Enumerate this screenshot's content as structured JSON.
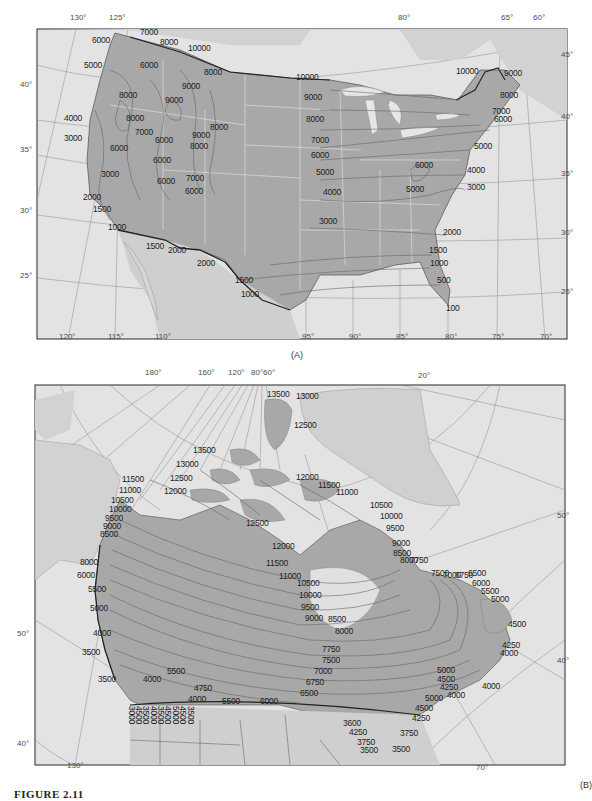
{
  "figure": {
    "caption": "FIGURE 2.11",
    "colors": {
      "land_highlight": "#a9a9a9",
      "land_other": "#d4d4d4",
      "ocean": "#e6e6e6",
      "contour": "#6b6b6b",
      "border": "#2b2b2b",
      "state_lines": "#f2f2f2",
      "text": "#1e1e1e"
    }
  },
  "panel_a": {
    "label": "(A)",
    "top_longitude_ticks": [
      {
        "text": "130°",
        "x": 70,
        "y": 20
      },
      {
        "text": "125°",
        "x": 109,
        "y": 20
      },
      {
        "text": "80°",
        "x": 398,
        "y": 20
      },
      {
        "text": "65°",
        "x": 501,
        "y": 20
      },
      {
        "text": "60°",
        "x": 533,
        "y": 20
      }
    ],
    "bottom_longitude_ticks": [
      {
        "text": "120°",
        "x": 59,
        "y": 339
      },
      {
        "text": "115°",
        "x": 108,
        "y": 339
      },
      {
        "text": "110°",
        "x": 155,
        "y": 339
      },
      {
        "text": "95°",
        "x": 302,
        "y": 339
      },
      {
        "text": "90°",
        "x": 349,
        "y": 339
      },
      {
        "text": "85°",
        "x": 396,
        "y": 339
      },
      {
        "text": "80°",
        "x": 445,
        "y": 339
      },
      {
        "text": "75°",
        "x": 492,
        "y": 339
      },
      {
        "text": "70°",
        "x": 540,
        "y": 339
      }
    ],
    "left_latitude_ticks": [
      {
        "text": "40°",
        "x": 20,
        "y": 87
      },
      {
        "text": "35°",
        "x": 20,
        "y": 152
      },
      {
        "text": "30°",
        "x": 20,
        "y": 213
      },
      {
        "text": "25°",
        "x": 20,
        "y": 278
      }
    ],
    "right_latitude_ticks": [
      {
        "text": "45°",
        "x": 561,
        "y": 57
      },
      {
        "text": "40°",
        "x": 561,
        "y": 119
      },
      {
        "text": "35°",
        "x": 561,
        "y": 176
      },
      {
        "text": "30°",
        "x": 561,
        "y": 235
      },
      {
        "text": "25°",
        "x": 561,
        "y": 294
      }
    ],
    "contour_labels": [
      {
        "text": "7000",
        "x": 140,
        "y": 34
      },
      {
        "text": "6000",
        "x": 92,
        "y": 42
      },
      {
        "text": "8000",
        "x": 160,
        "y": 44
      },
      {
        "text": "10000",
        "x": 188,
        "y": 50
      },
      {
        "text": "5000",
        "x": 84,
        "y": 67
      },
      {
        "text": "6000",
        "x": 140,
        "y": 67
      },
      {
        "text": "8000",
        "x": 204,
        "y": 74
      },
      {
        "text": "9000",
        "x": 182,
        "y": 88
      },
      {
        "text": "8000",
        "x": 119,
        "y": 97
      },
      {
        "text": "9000",
        "x": 165,
        "y": 102
      },
      {
        "text": "4000",
        "x": 64,
        "y": 120
      },
      {
        "text": "8000",
        "x": 126,
        "y": 120
      },
      {
        "text": "7000",
        "x": 135,
        "y": 134
      },
      {
        "text": "8000",
        "x": 210,
        "y": 129
      },
      {
        "text": "3000",
        "x": 64,
        "y": 140
      },
      {
        "text": "6000",
        "x": 155,
        "y": 142
      },
      {
        "text": "9000",
        "x": 192,
        "y": 137
      },
      {
        "text": "8000",
        "x": 190,
        "y": 148
      },
      {
        "text": "6000",
        "x": 110,
        "y": 150
      },
      {
        "text": "6000",
        "x": 153,
        "y": 162
      },
      {
        "text": "3000",
        "x": 101,
        "y": 176
      },
      {
        "text": "6000",
        "x": 157,
        "y": 183
      },
      {
        "text": "7000",
        "x": 186,
        "y": 180
      },
      {
        "text": "6000",
        "x": 185,
        "y": 193
      },
      {
        "text": "2000",
        "x": 83,
        "y": 199
      },
      {
        "text": "1500",
        "x": 93,
        "y": 211
      },
      {
        "text": "1000",
        "x": 108,
        "y": 229
      },
      {
        "text": "1500",
        "x": 146,
        "y": 248
      },
      {
        "text": "2000",
        "x": 168,
        "y": 252
      },
      {
        "text": "2000",
        "x": 197,
        "y": 265
      },
      {
        "text": "1500",
        "x": 235,
        "y": 282
      },
      {
        "text": "1000",
        "x": 241,
        "y": 296
      },
      {
        "text": "10000",
        "x": 296,
        "y": 79
      },
      {
        "text": "9000",
        "x": 304,
        "y": 99
      },
      {
        "text": "8000",
        "x": 306,
        "y": 121
      },
      {
        "text": "7000",
        "x": 311,
        "y": 142
      },
      {
        "text": "6000",
        "x": 311,
        "y": 157
      },
      {
        "text": "5000",
        "x": 316,
        "y": 174
      },
      {
        "text": "4000",
        "x": 323,
        "y": 194
      },
      {
        "text": "5000",
        "x": 406,
        "y": 191
      },
      {
        "text": "6000",
        "x": 415,
        "y": 167
      },
      {
        "text": "3000",
        "x": 319,
        "y": 223
      },
      {
        "text": "10000",
        "x": 456,
        "y": 73
      },
      {
        "text": "9000",
        "x": 504,
        "y": 75
      },
      {
        "text": "8000",
        "x": 500,
        "y": 97
      },
      {
        "text": "7000",
        "x": 492,
        "y": 113
      },
      {
        "text": "6000",
        "x": 494,
        "y": 121
      },
      {
        "text": "5000",
        "x": 474,
        "y": 148
      },
      {
        "text": "4000",
        "x": 467,
        "y": 172
      },
      {
        "text": "3000",
        "x": 467,
        "y": 189
      },
      {
        "text": "2000",
        "x": 443,
        "y": 234
      },
      {
        "text": "1500",
        "x": 429,
        "y": 252
      },
      {
        "text": "1000",
        "x": 430,
        "y": 265
      },
      {
        "text": "500",
        "x": 437,
        "y": 282
      },
      {
        "text": "100",
        "x": 446,
        "y": 310
      }
    ]
  },
  "panel_b": {
    "label": "(B)",
    "top_longitude_ticks": [
      {
        "text": "180°",
        "x": 145,
        "y": 375
      },
      {
        "text": "160°",
        "x": 198,
        "y": 375
      },
      {
        "text": "120°",
        "x": 228,
        "y": 375
      },
      {
        "text": "80°60°",
        "x": 251,
        "y": 375
      },
      {
        "text": "20°",
        "x": 418,
        "y": 378
      }
    ],
    "left_latitude_ticks": [
      {
        "text": "50°",
        "x": 17,
        "y": 636
      },
      {
        "text": "40°",
        "x": 17,
        "y": 746
      }
    ],
    "right_latitude_ticks": [
      {
        "text": "50°",
        "x": 557,
        "y": 518
      },
      {
        "text": "40°",
        "x": 557,
        "y": 663
      }
    ],
    "bottom_longitude_ticks": [
      {
        "text": "130°",
        "x": 67,
        "y": 768
      },
      {
        "text": "70°",
        "x": 476,
        "y": 770
      }
    ],
    "contour_labels": [
      {
        "text": "13500",
        "x": 267,
        "y": 396
      },
      {
        "text": "13000",
        "x": 296,
        "y": 398
      },
      {
        "text": "12500",
        "x": 294,
        "y": 427
      },
      {
        "text": "13500",
        "x": 193,
        "y": 452
      },
      {
        "text": "13000",
        "x": 176,
        "y": 466
      },
      {
        "text": "12500",
        "x": 170,
        "y": 480
      },
      {
        "text": "12000",
        "x": 164,
        "y": 493
      },
      {
        "text": "11500",
        "x": 122,
        "y": 481
      },
      {
        "text": "11000",
        "x": 119,
        "y": 492
      },
      {
        "text": "10500",
        "x": 111,
        "y": 502
      },
      {
        "text": "10000",
        "x": 109,
        "y": 511
      },
      {
        "text": "9500",
        "x": 105,
        "y": 520
      },
      {
        "text": "9000",
        "x": 103,
        "y": 528
      },
      {
        "text": "8500",
        "x": 100,
        "y": 536
      },
      {
        "text": "12000",
        "x": 296,
        "y": 479
      },
      {
        "text": "11500",
        "x": 318,
        "y": 487
      },
      {
        "text": "11000",
        "x": 336,
        "y": 494
      },
      {
        "text": "10500",
        "x": 370,
        "y": 507
      },
      {
        "text": "10000",
        "x": 380,
        "y": 518
      },
      {
        "text": "9500",
        "x": 386,
        "y": 530
      },
      {
        "text": "9000",
        "x": 392,
        "y": 545
      },
      {
        "text": "8500",
        "x": 393,
        "y": 555
      },
      {
        "text": "8000",
        "x": 400,
        "y": 562
      },
      {
        "text": "7750",
        "x": 410,
        "y": 562
      },
      {
        "text": "12500",
        "x": 246,
        "y": 525
      },
      {
        "text": "12000",
        "x": 272,
        "y": 548
      },
      {
        "text": "11500",
        "x": 266,
        "y": 565
      },
      {
        "text": "11000",
        "x": 279,
        "y": 578
      },
      {
        "text": "10500",
        "x": 297,
        "y": 585
      },
      {
        "text": "10000",
        "x": 299,
        "y": 597
      },
      {
        "text": "9500",
        "x": 301,
        "y": 609
      },
      {
        "text": "9000",
        "x": 305,
        "y": 620
      },
      {
        "text": "8500",
        "x": 328,
        "y": 621
      },
      {
        "text": "8000",
        "x": 335,
        "y": 633
      },
      {
        "text": "7750",
        "x": 322,
        "y": 651
      },
      {
        "text": "7500",
        "x": 322,
        "y": 662
      },
      {
        "text": "7000",
        "x": 314,
        "y": 673
      },
      {
        "text": "6750",
        "x": 306,
        "y": 684
      },
      {
        "text": "6500",
        "x": 300,
        "y": 695
      },
      {
        "text": "7500",
        "x": 431,
        "y": 575
      },
      {
        "text": "7000",
        "x": 443,
        "y": 577
      },
      {
        "text": "6750",
        "x": 455,
        "y": 577
      },
      {
        "text": "6500",
        "x": 468,
        "y": 575
      },
      {
        "text": "6000",
        "x": 472,
        "y": 585
      },
      {
        "text": "5500",
        "x": 481,
        "y": 593
      },
      {
        "text": "5000",
        "x": 491,
        "y": 601
      },
      {
        "text": "4500",
        "x": 508,
        "y": 626
      },
      {
        "text": "4250",
        "x": 502,
        "y": 647
      },
      {
        "text": "4000",
        "x": 500,
        "y": 655
      },
      {
        "text": "4000",
        "x": 482,
        "y": 688
      },
      {
        "text": "5000",
        "x": 437,
        "y": 672
      },
      {
        "text": "4500",
        "x": 437,
        "y": 681
      },
      {
        "text": "4250",
        "x": 440,
        "y": 689
      },
      {
        "text": "4000",
        "x": 447,
        "y": 697
      },
      {
        "text": "5000",
        "x": 425,
        "y": 700
      },
      {
        "text": "4500",
        "x": 415,
        "y": 710
      },
      {
        "text": "4250",
        "x": 412,
        "y": 720
      },
      {
        "text": "3600",
        "x": 343,
        "y": 725
      },
      {
        "text": "4250",
        "x": 349,
        "y": 734
      },
      {
        "text": "3750",
        "x": 400,
        "y": 735
      },
      {
        "text": "3750",
        "x": 357,
        "y": 744
      },
      {
        "text": "3500",
        "x": 360,
        "y": 752
      },
      {
        "text": "3500",
        "x": 392,
        "y": 751
      },
      {
        "text": "8000",
        "x": 80,
        "y": 564
      },
      {
        "text": "6000",
        "x": 77,
        "y": 577
      },
      {
        "text": "5500",
        "x": 88,
        "y": 591
      },
      {
        "text": "5000",
        "x": 90,
        "y": 610
      },
      {
        "text": "4000",
        "x": 93,
        "y": 635
      },
      {
        "text": "3500",
        "x": 82,
        "y": 654
      },
      {
        "text": "3500",
        "x": 98,
        "y": 681
      },
      {
        "text": "4000",
        "x": 143,
        "y": 681
      },
      {
        "text": "5500",
        "x": 167,
        "y": 673
      },
      {
        "text": "4750",
        "x": 194,
        "y": 690
      },
      {
        "text": "4000",
        "x": 188,
        "y": 701
      },
      {
        "text": "5500",
        "x": 222,
        "y": 703
      },
      {
        "text": "6000",
        "x": 260,
        "y": 703
      }
    ],
    "rotated_labels": [
      {
        "text": "3000",
        "x": 136,
        "y": 712
      },
      {
        "text": "4500",
        "x": 143,
        "y": 712
      },
      {
        "text": "3500",
        "x": 150,
        "y": 712
      },
      {
        "text": "4000",
        "x": 158,
        "y": 712
      },
      {
        "text": "3500",
        "x": 165,
        "y": 712
      },
      {
        "text": "4500",
        "x": 172,
        "y": 712
      },
      {
        "text": "5000",
        "x": 180,
        "y": 712
      },
      {
        "text": "4500",
        "x": 187,
        "y": 712
      },
      {
        "text": "3500",
        "x": 195,
        "y": 712
      }
    ]
  }
}
